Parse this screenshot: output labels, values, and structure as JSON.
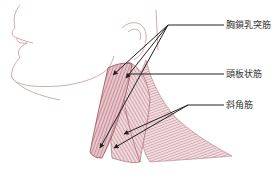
{
  "diagram": {
    "title": "",
    "labels": [
      {
        "id": "scm",
        "text": "胸鎖乳突筋",
        "x": 226,
        "y": 20
      },
      {
        "id": "splenius",
        "text": "頭板状筋",
        "x": 226,
        "y": 69
      },
      {
        "id": "scalene",
        "text": "斜角筋",
        "x": 226,
        "y": 101
      }
    ],
    "colors": {
      "muscle_fill": "#c98f96",
      "muscle_dark": "#8a3a48",
      "muscle_light": "#efd6d9",
      "outline": "#c79aa0",
      "leader_line": "#333333"
    }
  }
}
